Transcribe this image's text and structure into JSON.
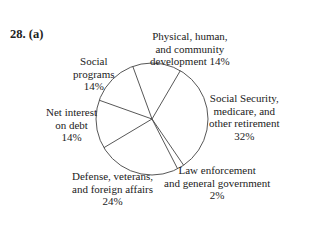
{
  "problem_label": "28.  (a)",
  "labels": {
    "physical": [
      "Physical, human,",
      "and community",
      "development 14%"
    ],
    "social_programs": [
      "Social",
      "programs",
      "14%"
    ],
    "social_security": [
      "Social Security,",
      "medicare, and",
      "other retirement",
      "32%"
    ],
    "net_interest": [
      "Net interest",
      "on debt",
      "14%"
    ],
    "defense": [
      "Defense, veterans,",
      "and foreign affairs",
      "24%"
    ],
    "law": [
      "Law enforcement",
      "and general government",
      "2%"
    ]
  },
  "chart_data": {
    "type": "pie",
    "title": "",
    "categories": [
      "Physical, human, and community development",
      "Social Security, medicare, and other retirement",
      "Law enforcement and general government",
      "Defense, veterans, and foreign affairs",
      "Net interest on debt",
      "Social programs"
    ],
    "values": [
      14,
      32,
      2,
      24,
      14,
      14
    ],
    "units": "%",
    "fill": "none",
    "stroke": "#333333"
  }
}
